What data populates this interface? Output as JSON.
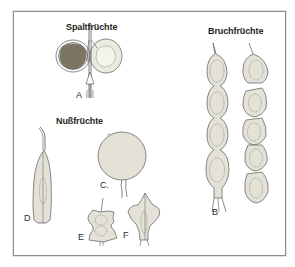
{
  "figure": {
    "groups": [
      {
        "id": "spalt",
        "heading": "Spaltfrüchte"
      },
      {
        "id": "bruch",
        "heading": "Bruchfrüchte"
      },
      {
        "id": "nuss",
        "heading": "Nußfrüchte"
      }
    ],
    "labels": {
      "A": "A",
      "B": "B",
      "C": "C.",
      "D": "D",
      "E": "E",
      "F": "F"
    },
    "colors": {
      "frame": "#8d8d8d",
      "fruit_fill": "#e4e2d6",
      "fruit_fill_light": "#eeece2",
      "seed_dark": "#7d7563",
      "outline": "#6b6b6b",
      "background": "#ffffff"
    }
  }
}
